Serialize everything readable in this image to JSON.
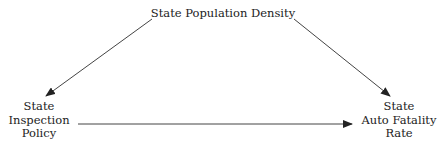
{
  "diagram": {
    "type": "causal-diagram",
    "nodes": {
      "top": {
        "label": "State Population Density"
      },
      "left": {
        "line1": "State",
        "line2": "Inspection",
        "line3": "Policy"
      },
      "right": {
        "line1": "State",
        "line2": "Auto Fatality",
        "line3": "Rate"
      }
    },
    "edges": [
      {
        "from": "State Population Density",
        "to": "State Inspection Policy"
      },
      {
        "from": "State Population Density",
        "to": "State Auto Fatality Rate"
      },
      {
        "from": "State Inspection Policy",
        "to": "State Auto Fatality Rate"
      }
    ],
    "colors": {
      "line": "#333333",
      "text": "#222222",
      "background": "#ffffff"
    }
  }
}
